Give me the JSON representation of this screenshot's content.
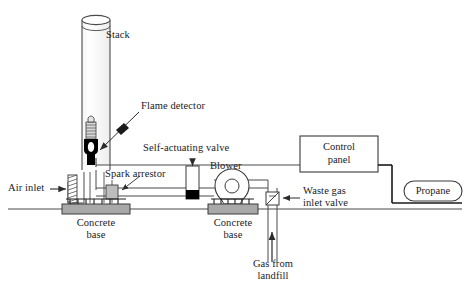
{
  "figure": {
    "type": "process-flow-diagram",
    "background_color": "#ffffff",
    "line_color": "#3a3a3a",
    "fill_gray": "#b3b3b3",
    "fill_black": "#000000"
  },
  "labels": {
    "stack": "Stack",
    "flame_detector": "Flame detector",
    "self_actuating_valve": "Self-actuating valve",
    "spark_arrestor": "Spark arrestor",
    "blower": "Blower",
    "air_inlet": "Air inlet",
    "concrete_base_left_line1": "Concrete",
    "concrete_base_left_line2": "base",
    "concrete_base_right_line1": "Concrete",
    "concrete_base_right_line2": "base",
    "control_panel_line1": "Control",
    "control_panel_line2": "panel",
    "propane": "Propane",
    "waste_gas_valve_line1": "Waste gas",
    "waste_gas_valve_line2": "inlet valve",
    "gas_from_landfill_line1": "Gas from",
    "gas_from_landfill_line2": "landfill"
  },
  "components": [
    {
      "name": "stack",
      "shape": "vertical-cylinder-open-top"
    },
    {
      "name": "flame-detector",
      "shape": "pilot-burner"
    },
    {
      "name": "self-actuating-valve",
      "shape": "vertical-valve-body"
    },
    {
      "name": "spark-arrestor",
      "shape": "small-gray-block"
    },
    {
      "name": "blower",
      "shape": "centrifugal-fan-circle"
    },
    {
      "name": "air-inlet",
      "shape": "hatched-louver"
    },
    {
      "name": "concrete-base-left",
      "shape": "hatched-gray-slab"
    },
    {
      "name": "concrete-base-right",
      "shape": "hatched-gray-slab"
    },
    {
      "name": "control-panel",
      "shape": "rectangle"
    },
    {
      "name": "propane-tank",
      "shape": "rounded-capsule"
    },
    {
      "name": "waste-gas-inlet-valve",
      "shape": "butterfly-valve"
    },
    {
      "name": "gas-from-landfill-inlet",
      "shape": "up-arrow-pipe"
    },
    {
      "name": "ground-line",
      "shape": "horizontal-line"
    }
  ]
}
